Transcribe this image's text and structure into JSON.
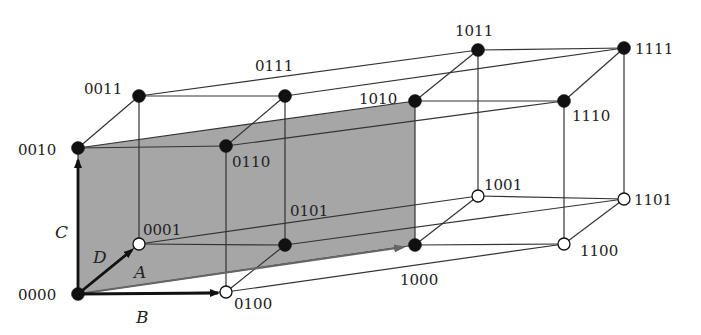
{
  "diagram": {
    "type": "4D hypercube (Karnaugh-style Boolean cube)",
    "colors": {
      "plane_fill": "#a6a6a6",
      "edge": "#333333",
      "filled_node": "#111111",
      "open_node": "#ffffff",
      "arrow": "#111111",
      "arrow_A": "#666666"
    },
    "plane": {
      "name": "shaded-plane",
      "corners": [
        "0000",
        "0010",
        "1010",
        "1000"
      ]
    },
    "nodes": [
      {
        "id": "0000",
        "label": "0000",
        "x": 78,
        "y": 294,
        "filled": true,
        "lx": 18,
        "ly": 300
      },
      {
        "id": "0100",
        "label": "0100",
        "x": 226,
        "y": 292,
        "filled": false,
        "lx": 234,
        "ly": 309
      },
      {
        "id": "0001",
        "label": "0001",
        "x": 139,
        "y": 244,
        "filled": false,
        "lx": 143,
        "ly": 235
      },
      {
        "id": "0101",
        "label": "0101",
        "x": 285,
        "y": 245,
        "filled": true,
        "lx": 290,
        "ly": 216
      },
      {
        "id": "0010",
        "label": "0010",
        "x": 78,
        "y": 148,
        "filled": true,
        "lx": 18,
        "ly": 155
      },
      {
        "id": "0110",
        "label": "0110",
        "x": 226,
        "y": 146,
        "filled": true,
        "lx": 232,
        "ly": 167
      },
      {
        "id": "0011",
        "label": "0011",
        "x": 139,
        "y": 96,
        "filled": true,
        "lx": 84,
        "ly": 94
      },
      {
        "id": "0111",
        "label": "0111",
        "x": 285,
        "y": 96,
        "filled": true,
        "lx": 255,
        "ly": 71
      },
      {
        "id": "1000",
        "label": "1000",
        "x": 415,
        "y": 245,
        "filled": true,
        "lx": 400,
        "ly": 285
      },
      {
        "id": "1100",
        "label": "1100",
        "x": 564,
        "y": 244,
        "filled": false,
        "lx": 580,
        "ly": 256
      },
      {
        "id": "1001",
        "label": "1001",
        "x": 478,
        "y": 196,
        "filled": false,
        "lx": 484,
        "ly": 190
      },
      {
        "id": "1101",
        "label": "1101",
        "x": 624,
        "y": 199,
        "filled": false,
        "lx": 634,
        "ly": 205
      },
      {
        "id": "1010",
        "label": "1010",
        "x": 415,
        "y": 101,
        "filled": true,
        "lx": 359,
        "ly": 104
      },
      {
        "id": "1110",
        "label": "1110",
        "x": 564,
        "y": 101,
        "filled": true,
        "lx": 572,
        "ly": 121
      },
      {
        "id": "1011",
        "label": "1011",
        "x": 478,
        "y": 50,
        "filled": true,
        "lx": 455,
        "ly": 36
      },
      {
        "id": "1111",
        "label": "1111",
        "x": 624,
        "y": 48,
        "filled": true,
        "lx": 635,
        "ly": 54
      }
    ],
    "edges": [
      [
        "0000",
        "0100"
      ],
      [
        "0000",
        "0001"
      ],
      [
        "0000",
        "0010"
      ],
      [
        "0000",
        "1000"
      ],
      [
        "0100",
        "0101"
      ],
      [
        "0100",
        "0110"
      ],
      [
        "0100",
        "1100"
      ],
      [
        "0001",
        "0101"
      ],
      [
        "0001",
        "0011"
      ],
      [
        "0001",
        "1001"
      ],
      [
        "0101",
        "0111"
      ],
      [
        "0101",
        "1101"
      ],
      [
        "0010",
        "0110"
      ],
      [
        "0010",
        "0011"
      ],
      [
        "0010",
        "1010"
      ],
      [
        "0110",
        "0111"
      ],
      [
        "0110",
        "1110"
      ],
      [
        "0011",
        "0111"
      ],
      [
        "0011",
        "1011"
      ],
      [
        "0111",
        "1111"
      ],
      [
        "1000",
        "1100"
      ],
      [
        "1000",
        "1001"
      ],
      [
        "1000",
        "1010"
      ],
      [
        "1100",
        "1101"
      ],
      [
        "1100",
        "1110"
      ],
      [
        "1001",
        "1101"
      ],
      [
        "1001",
        "1011"
      ],
      [
        "1101",
        "1111"
      ],
      [
        "1010",
        "1110"
      ],
      [
        "1010",
        "1011"
      ],
      [
        "1110",
        "1111"
      ],
      [
        "1011",
        "1111"
      ]
    ],
    "axes": [
      {
        "name": "A",
        "label": "A",
        "from": [
          78,
          294
        ],
        "to": [
          404,
          247
        ],
        "lx": 134,
        "ly": 278,
        "color": "#666666"
      },
      {
        "name": "B",
        "label": "B",
        "from": [
          78,
          294
        ],
        "to": [
          218,
          293
        ],
        "lx": 136,
        "ly": 323,
        "color": "#111111"
      },
      {
        "name": "C",
        "label": "C",
        "from": [
          78,
          294
        ],
        "to": [
          78,
          160
        ],
        "lx": 55,
        "ly": 238,
        "color": "#111111"
      },
      {
        "name": "D",
        "label": "D",
        "from": [
          78,
          294
        ],
        "to": [
          132,
          250
        ],
        "lx": 93,
        "ly": 263,
        "color": "#111111"
      }
    ]
  }
}
